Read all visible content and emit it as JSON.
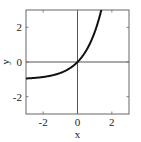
{
  "chart_data": {
    "type": "line",
    "title": "",
    "xlabel": "x",
    "ylabel": "y",
    "xlim": [
      -3,
      3
    ],
    "ylim": [
      -3,
      3
    ],
    "x_ticks": [
      -2,
      0,
      2
    ],
    "y_ticks": [
      -2,
      0,
      2
    ],
    "x_tick_labels": [
      "-2",
      "0",
      "2"
    ],
    "y_tick_labels": [
      "-2",
      "0",
      "2"
    ],
    "grid": false,
    "reference_lines": {
      "x": 0,
      "y": 0
    },
    "series": [
      {
        "name": "y = e^x - 1",
        "x": [
          -3,
          -2.5,
          -2,
          -1.5,
          -1,
          -0.5,
          0,
          0.5,
          1,
          1.386
        ],
        "y": [
          -0.95,
          -0.92,
          -0.86,
          -0.78,
          -0.63,
          -0.39,
          0,
          0.65,
          1.72,
          3.0
        ]
      }
    ]
  }
}
